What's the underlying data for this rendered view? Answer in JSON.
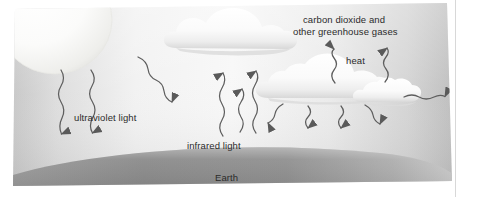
{
  "diagram": {
    "title_visible": false,
    "labels": {
      "ultraviolet_light": "ultraviolet light",
      "infrared_light": "infrared light",
      "greenhouse_gases_line1": "carbon dioxide and",
      "greenhouse_gases_line2": "other greenhouse gases",
      "heat": "heat",
      "earth": "Earth"
    },
    "elements": {
      "sun": "sun-disc",
      "cloud_top": "cloud",
      "cloud_right_large": "cloud",
      "cloud_right_small": "cloud",
      "ground": "earth-surface-band"
    },
    "arrows": {
      "ultraviolet_incoming_count": 3,
      "infrared_outgoing_count": 3,
      "heat_upward_count": 2,
      "heat_downward_count": 4,
      "heat_rightward_count": 1
    },
    "colors": {
      "sky_light": "#f4f4f4",
      "sky_edge": "#c9c9c9",
      "cloud": "#fbfbfb",
      "cloud_shadow": "#d2d2d2",
      "sun": "#f2f2f0",
      "earth_band": "#8f8f8f",
      "earth_band_light": "#b8b8b8",
      "arrow": "#5e5e5e",
      "text": "#2b2b2b"
    }
  }
}
